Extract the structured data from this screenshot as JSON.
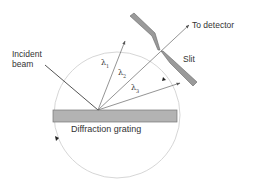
{
  "labels": {
    "incident_line1": "Incident",
    "incident_line2": "beam",
    "to_detector": "To detector",
    "slit": "Slit",
    "grating": "Diffraction grating",
    "lambda1": "λ",
    "lambda1_sub": "1",
    "lambda2": "λ",
    "lambda2_sub": "2",
    "lambda3": "λ",
    "lambda3_sub": "3"
  },
  "colors": {
    "grating_fill": "#b3b3b3",
    "slit_fill": "#9a9a9a",
    "line": "#555555",
    "circle": "#cccccc"
  }
}
